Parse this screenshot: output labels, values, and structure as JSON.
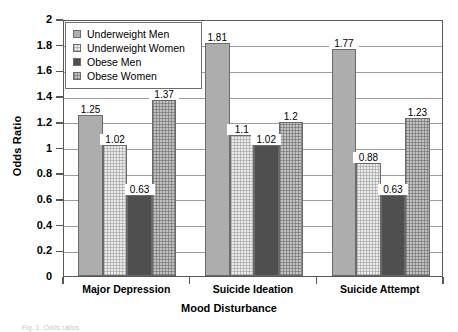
{
  "chart_data": {
    "type": "bar",
    "title": "",
    "xlabel": "Mood Disturbance",
    "ylabel": "Odds Ratio",
    "categories": [
      "Major Depression",
      "Suicide Ideation",
      "Suicide Attempt"
    ],
    "series": [
      {
        "name": "Underweight Men",
        "values": [
          1.25,
          1.81,
          1.77
        ],
        "swatch_color": "#adadad"
      },
      {
        "name": "Underweight Women",
        "values": [
          1.02,
          1.1,
          0.88
        ],
        "swatch_color": "#ebebeb"
      },
      {
        "name": "Obese Men",
        "values": [
          0.63,
          1.02,
          0.63
        ],
        "swatch_color": "#4f4f4f"
      },
      {
        "name": "Obese Women",
        "values": [
          1.37,
          1.2,
          1.23
        ],
        "swatch_color": "#c2c2c2"
      }
    ],
    "ylim": [
      0,
      2
    ],
    "yticks": [
      "0",
      "0.2",
      "0.4",
      "0.6",
      "0.8",
      "1",
      "1.2",
      "1.4",
      "1.6",
      "1.8",
      "2"
    ],
    "grid": "horizontal",
    "legend_position": "top-left-inside",
    "value_labels": [
      [
        "1.25",
        "1.02",
        "0.63",
        "1.37"
      ],
      [
        "1.81",
        "1.1",
        "1.02",
        "1.2"
      ],
      [
        "1.77",
        "0.88",
        "0.63",
        "1.23"
      ]
    ]
  },
  "caption": "Fig. 1. Odds ratios"
}
